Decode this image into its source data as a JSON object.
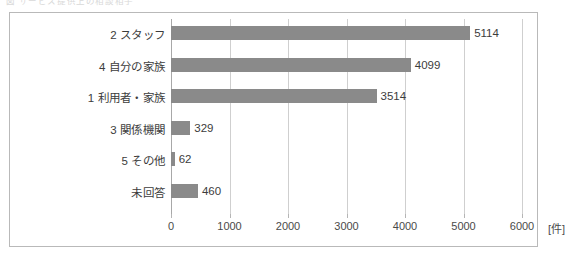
{
  "caption": {
    "text": "図  サービス提供上の相談相手"
  },
  "chart_data": {
    "type": "bar",
    "orientation": "horizontal",
    "title": "",
    "xlabel": "[件]",
    "ylabel": "",
    "unit_label": "[件]",
    "categories": [
      "2 スタッフ",
      "4 自分の家族",
      "1 利用者・家族",
      "3 関係機関",
      "5 その他",
      "未回答"
    ],
    "values": [
      5114,
      4099,
      3514,
      329,
      62,
      460
    ],
    "value_labels": [
      "5114",
      "4099",
      "3514",
      "329",
      "62",
      "460"
    ],
    "xlim": [
      0,
      6500
    ],
    "xticks": [
      0,
      1000,
      2000,
      3000,
      4000,
      5000,
      6000
    ],
    "xtick_labels": [
      "0",
      "1000",
      "2000",
      "3000",
      "4000",
      "5000",
      "6000"
    ],
    "grid": true,
    "legend": null,
    "bar_color": "#8a8a8a",
    "grid_color": "#cfcfcf",
    "frame_color": "#b9b9b9",
    "text_color": "#3c3c3c"
  }
}
